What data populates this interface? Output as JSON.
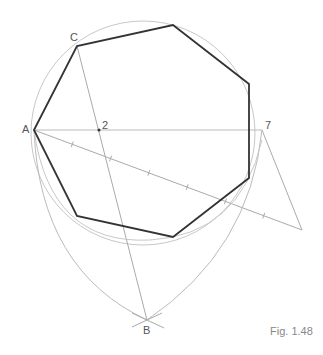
{
  "figure": {
    "caption": "Fig. 1.48"
  },
  "labels": {
    "A": "A",
    "B": "B",
    "C": "C",
    "p2": "2",
    "p7": "7"
  },
  "polygon": {
    "sides": 7,
    "shape": "regular heptagon"
  },
  "divisions": {
    "count": 7,
    "marked_points": [
      "2",
      "7"
    ]
  },
  "colors": {
    "polygon": "#333333",
    "construction": "#bbbbbb",
    "label": "#555555"
  }
}
